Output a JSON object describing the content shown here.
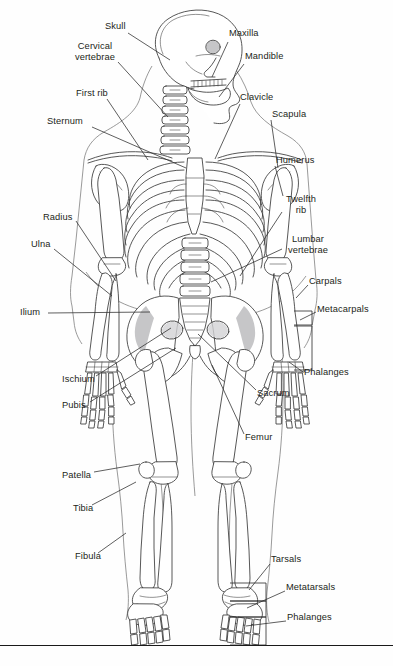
{
  "diagram": {
    "view": "anterior (front) view, head turned to profile",
    "background_color": "#fefefe",
    "line_color": "#333333",
    "text_color": "#231f20",
    "shading_color": "#b9b9bb"
  },
  "labels": {
    "skull": "Skull",
    "cervical_vertebrae": "Cervical\nvertebrae",
    "first_rib": "First rib",
    "sternum": "Sternum",
    "maxilla": "Maxilla",
    "mandible": "Mandible",
    "clavicle": "Clavicle",
    "scapula": "Scapula",
    "humerus": "Humerus",
    "twelfth_rib": "Twelfth\nrib",
    "lumbar_vertebrae": "Lumbar\nvertebrae",
    "radius": "Radius",
    "ulna": "Ulna",
    "ilium": "Ilium",
    "carpals": "Carpals",
    "metacarpals": "Metacarpals",
    "phalanges_hand": "Phalanges",
    "ischium": "Ischium",
    "pubis": "Pubis",
    "sacrum": "Sacrum",
    "femur": "Femur",
    "patella": "Patella",
    "tibia": "Tibia",
    "fibula": "Fibula",
    "tarsals": "Tarsals",
    "metatarsals": "Metatarsals",
    "phalanges_foot": "Phalanges"
  },
  "label_list": [
    {
      "id": "skull",
      "text": "Skull",
      "x": 105,
      "y": 26,
      "align": "left"
    },
    {
      "id": "cervical-vertebrae",
      "text": "Cervical vertebrae",
      "x": 70,
      "y": 46,
      "align": "left"
    },
    {
      "id": "first-rib",
      "text": "First rib",
      "x": 77,
      "y": 92,
      "align": "left"
    },
    {
      "id": "sternum",
      "text": "Sternum",
      "x": 47,
      "y": 120,
      "align": "left"
    },
    {
      "id": "maxilla",
      "text": "Maxilla",
      "x": 230,
      "y": 33,
      "align": "left"
    },
    {
      "id": "mandible",
      "text": "Mandible",
      "x": 246,
      "y": 56,
      "align": "left"
    },
    {
      "id": "clavicle",
      "text": "Clavicle",
      "x": 241,
      "y": 96,
      "align": "left"
    },
    {
      "id": "scapula",
      "text": "Scapula",
      "x": 273,
      "y": 113,
      "align": "left"
    },
    {
      "id": "humerus",
      "text": "Humerus",
      "x": 277,
      "y": 159,
      "align": "left"
    },
    {
      "id": "twelfth-rib",
      "text": "Twelfth rib",
      "x": 285,
      "y": 198,
      "align": "left"
    },
    {
      "id": "lumbar-vertebrae",
      "text": "Lumbar vertebrae",
      "x": 284,
      "y": 238,
      "align": "left"
    },
    {
      "id": "radius",
      "text": "Radius",
      "x": 44,
      "y": 216,
      "align": "left"
    },
    {
      "id": "ulna",
      "text": "Ulna",
      "x": 31,
      "y": 243,
      "align": "left"
    },
    {
      "id": "ilium",
      "text": "Ilium",
      "x": 21,
      "y": 310,
      "align": "left"
    },
    {
      "id": "carpals",
      "text": "Carpals",
      "x": 310,
      "y": 280,
      "align": "left"
    },
    {
      "id": "metacarpals",
      "text": "Metacarpals",
      "x": 318,
      "y": 308,
      "align": "left"
    },
    {
      "id": "phalanges-hand",
      "text": "Phalanges",
      "x": 305,
      "y": 371,
      "align": "left"
    },
    {
      "id": "ischium",
      "text": "Ischium",
      "x": 63,
      "y": 378,
      "align": "left"
    },
    {
      "id": "pubis",
      "text": "Pubis",
      "x": 63,
      "y": 404,
      "align": "left"
    },
    {
      "id": "sacrum",
      "text": "Sacrum",
      "x": 258,
      "y": 392,
      "align": "left"
    },
    {
      "id": "femur",
      "text": "Femur",
      "x": 246,
      "y": 436,
      "align": "left"
    },
    {
      "id": "patella",
      "text": "Patella",
      "x": 63,
      "y": 474,
      "align": "left"
    },
    {
      "id": "tibia",
      "text": "Tibia",
      "x": 74,
      "y": 507,
      "align": "left"
    },
    {
      "id": "fibula",
      "text": "Fibula",
      "x": 76,
      "y": 555,
      "align": "left"
    },
    {
      "id": "tarsals",
      "text": "Tarsals",
      "x": 272,
      "y": 558,
      "align": "left"
    },
    {
      "id": "metatarsals",
      "text": "Metatarsals",
      "x": 287,
      "y": 586,
      "align": "left"
    },
    {
      "id": "phalanges-foot",
      "text": "Phalanges",
      "x": 288,
      "y": 616,
      "align": "left"
    }
  ]
}
